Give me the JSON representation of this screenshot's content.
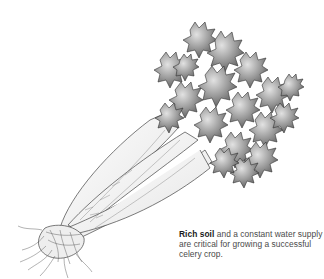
{
  "illustration": {
    "subject": "celery-bunch",
    "style": "grayscale pencil illustration"
  },
  "caption": {
    "bold": "Rich soil",
    "rest": " and a constant water supply are critical for growing a successful celery crop."
  },
  "colors": {
    "background": "#ffffff",
    "ink": "#333333",
    "leaf_dark": "#6e6e6e",
    "leaf_mid": "#9a9a9a",
    "leaf_light": "#d0d0d0",
    "stalk": "#f2f2f2",
    "caption_text": "#4a4a4a"
  }
}
